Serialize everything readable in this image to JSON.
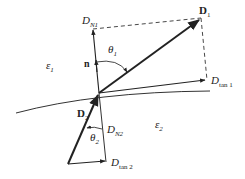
{
  "diagram": {
    "regions": {
      "upper": {
        "symbol": "ε",
        "sub": "1"
      },
      "lower": {
        "symbol": "ε",
        "sub": "2"
      }
    },
    "vectors": {
      "D1": {
        "main": "D",
        "sub": "1"
      },
      "D2": {
        "main": "D",
        "sub": "2"
      },
      "DN1": {
        "main": "D",
        "sub": "N1"
      },
      "DN2": {
        "main": "D",
        "sub": "N2"
      },
      "Dtan1": {
        "main": "D",
        "sub": "tan 1"
      },
      "Dtan2": {
        "main": "D",
        "sub": "tan 2"
      },
      "normal": {
        "main": "n"
      }
    },
    "angles": {
      "theta1": {
        "main": "θ",
        "sub": "1"
      },
      "theta2": {
        "main": "θ",
        "sub": "2"
      }
    },
    "colors": {
      "stroke": "#222222",
      "background": "#ffffff"
    }
  }
}
